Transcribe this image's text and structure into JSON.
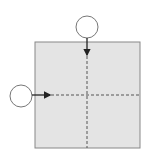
{
  "diagram": {
    "square": {
      "x": 35,
      "y": 42,
      "size": 105,
      "fill": "#e4e4e4",
      "stroke": "#888888"
    },
    "dashed_lines": {
      "vertical_x": 87,
      "horizontal_y": 95,
      "color": "#555555"
    },
    "circles": [
      {
        "name": "top-circle",
        "cx": 87,
        "cy": 27,
        "r": 11
      },
      {
        "name": "left-circle",
        "cx": 21,
        "cy": 96,
        "r": 11
      }
    ],
    "arrows": [
      {
        "name": "top-arrow",
        "from": [
          87,
          38
        ],
        "to": [
          87,
          56
        ]
      },
      {
        "name": "left-arrow",
        "from": [
          32,
          95
        ],
        "to": [
          51,
          95
        ]
      }
    ]
  }
}
